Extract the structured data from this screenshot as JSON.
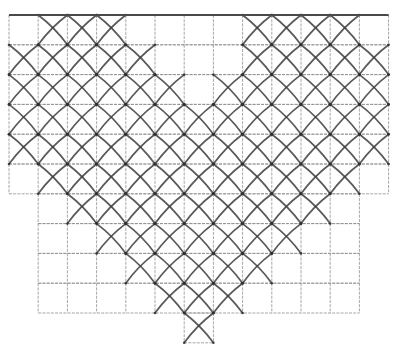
{
  "drawing": {
    "title": "Pencil sketch of square grid with diagonal lattice in V/heart pattern",
    "colors": {
      "paper": "#ffffff",
      "grid": "#8a8a8a",
      "lattice": "#3c3c3c",
      "top_edge": "#4a4a4a"
    },
    "grid": {
      "origin_x": 9,
      "origin_y": 15,
      "cell_w": 29.2,
      "cell_h": 29.8,
      "cols": 13,
      "rows": 11
    },
    "grid_rows_extent": [
      {
        "row": 0,
        "from_col": 0,
        "to_col": 13
      },
      {
        "row": 1,
        "from_col": 0,
        "to_col": 13
      },
      {
        "row": 2,
        "from_col": 0,
        "to_col": 13
      },
      {
        "row": 3,
        "from_col": 0,
        "to_col": 13
      },
      {
        "row": 4,
        "from_col": 0,
        "to_col": 13
      },
      {
        "row": 5,
        "from_col": 0,
        "to_col": 13
      },
      {
        "row": 6,
        "from_col": 1,
        "to_col": 12
      },
      {
        "row": 7,
        "from_col": 1,
        "to_col": 12
      },
      {
        "row": 8,
        "from_col": 1,
        "to_col": 12
      },
      {
        "row": 9,
        "from_col": 1,
        "to_col": 12
      },
      {
        "row": 10,
        "from_col": 6,
        "to_col": 7
      }
    ],
    "lattice_cells": [
      {
        "row": 0,
        "cols": [
          1,
          2,
          3,
          8,
          9,
          10,
          11
        ]
      },
      {
        "row": 1,
        "cols": [
          0,
          1,
          2,
          3,
          4,
          8,
          9,
          10,
          11,
          12
        ]
      },
      {
        "row": 2,
        "cols": [
          0,
          1,
          2,
          3,
          4,
          5,
          7,
          8,
          9,
          10,
          11,
          12
        ]
      },
      {
        "row": 3,
        "cols": [
          0,
          1,
          2,
          3,
          4,
          5,
          6,
          7,
          8,
          9,
          10,
          11,
          12
        ]
      },
      {
        "row": 4,
        "cols": [
          0,
          1,
          2,
          3,
          4,
          5,
          6,
          7,
          8,
          9,
          10,
          11,
          12
        ]
      },
      {
        "row": 5,
        "cols": [
          1,
          2,
          3,
          4,
          5,
          6,
          7,
          8,
          9,
          10,
          11
        ]
      },
      {
        "row": 6,
        "cols": [
          2,
          3,
          4,
          5,
          6,
          7,
          8,
          9,
          10
        ]
      },
      {
        "row": 7,
        "cols": [
          3,
          4,
          5,
          6,
          7,
          8,
          9
        ]
      },
      {
        "row": 8,
        "cols": [
          4,
          5,
          6,
          7,
          8
        ]
      },
      {
        "row": 9,
        "cols": [
          5,
          6,
          7
        ]
      },
      {
        "row": 10,
        "cols": [
          6
        ]
      }
    ]
  }
}
